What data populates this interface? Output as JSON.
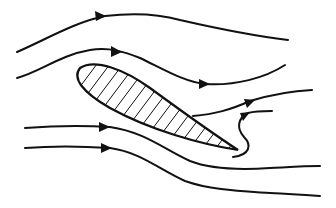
{
  "diagram": {
    "type": "airfoil flow diagram",
    "colors": {
      "stroke": "#111111",
      "background": "#ffffff"
    },
    "elements": [
      {
        "name": "streamline-top",
        "arrow": "right"
      },
      {
        "name": "streamline-upper",
        "arrows": [
          "right",
          "right"
        ]
      },
      {
        "name": "streamline-separated",
        "arrow": "right"
      },
      {
        "name": "streamline-reverse-eddy",
        "arrow": "up-right"
      },
      {
        "name": "streamline-lower",
        "arrow": "right"
      },
      {
        "name": "streamline-bottom",
        "arrow": "right"
      },
      {
        "name": "airfoil",
        "fill": "hatched"
      }
    ]
  }
}
